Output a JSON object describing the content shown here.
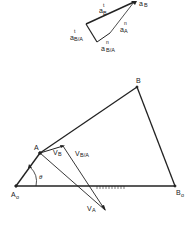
{
  "figure": {
    "acceleration_polygon": {
      "labels": {
        "aB_t": {
          "base": "a",
          "sup": "t",
          "sub": "B"
        },
        "aB": {
          "base": "a",
          "sub": "B"
        },
        "aA_n": {
          "base": "a",
          "sup": "n",
          "sub": "A"
        },
        "aBA_t": {
          "base": "a",
          "sup": "t",
          "sub": "B/A"
        },
        "aBA_n": {
          "base": "a",
          "sup": "n",
          "sub": "B/A"
        }
      }
    },
    "linkage": {
      "points": {
        "A0": {
          "base": "A",
          "sub": "o"
        },
        "A": "A",
        "B": "B",
        "B0": {
          "base": "B",
          "sub": "o"
        }
      },
      "vectors": {
        "VB": {
          "base": "V",
          "sub": "B"
        },
        "VBA": {
          "base": "V",
          "sub": "B/A"
        },
        "VA": {
          "base": "V",
          "sub": "A"
        }
      },
      "angle": "θ"
    }
  }
}
